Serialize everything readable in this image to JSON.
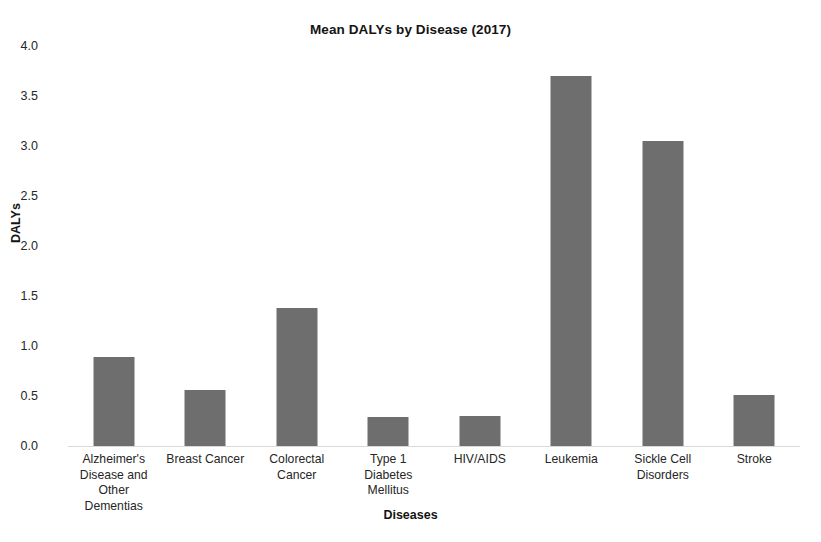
{
  "chart_data": {
    "type": "bar",
    "title": "Mean DALYs by Disease (2017)",
    "xlabel": "Diseases",
    "ylabel": "DALYs",
    "categories": [
      "Alzheimer's Disease and Other Dementias",
      "Breast Cancer",
      "Colorectal Cancer",
      "Type 1 Diabetes Mellitus",
      "HIV/AIDS",
      "Leukemia",
      "Sickle Cell Disorders",
      "Stroke"
    ],
    "category_lines": [
      [
        "Alzheimer's",
        "Disease and",
        "Other",
        "Dementias"
      ],
      [
        "Breast Cancer"
      ],
      [
        "Colorectal",
        "Cancer"
      ],
      [
        "Type 1",
        "Diabetes",
        "Mellitus"
      ],
      [
        "HIV/AIDS"
      ],
      [
        "Leukemia"
      ],
      [
        "Sickle Cell",
        "Disorders"
      ],
      [
        "Stroke"
      ]
    ],
    "values": [
      0.89,
      0.56,
      1.38,
      0.29,
      0.3,
      3.7,
      3.05,
      0.51
    ],
    "ylim": [
      0.0,
      4.0
    ],
    "ytick_labels": [
      "0.0",
      "0.5",
      "1.0",
      "1.5",
      "2.0",
      "2.5",
      "3.0",
      "3.5",
      "4.0"
    ],
    "ytick_values": [
      0.0,
      0.5,
      1.0,
      1.5,
      2.0,
      2.5,
      3.0,
      3.5,
      4.0
    ],
    "grid": false,
    "legend": null,
    "bar_color": "#6e6e6e",
    "axis_color": "#d9d9d9",
    "background": "#ffffff"
  }
}
